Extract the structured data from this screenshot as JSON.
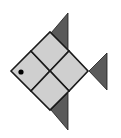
{
  "diagram": {
    "colors": {
      "background": "#ffffff",
      "diamond_fill": "#cfcfcf",
      "fin_fill": "#5a5a5a",
      "outline": "#1a1a1a",
      "gap_line": "#ffffff",
      "eye": "#000000"
    },
    "shapes": {
      "diamonds": [
        {
          "name": "diamond-left",
          "points": "11,71 31,51 50,71 31,91"
        },
        {
          "name": "diamond-top",
          "points": "31,51 50,32 69,51 50,71"
        },
        {
          "name": "diamond-right",
          "points": "50,71 69,51 88,71 69,91"
        },
        {
          "name": "diamond-bottom",
          "points": "31,91 50,71 69,91 50,110"
        }
      ],
      "fins": [
        {
          "name": "top-fin",
          "points": "51,33 68,13 68,50"
        },
        {
          "name": "bottom-fin",
          "points": "51,110 68,93 68,130"
        },
        {
          "name": "tail-fin",
          "points": "89,71 107,53 107,90"
        }
      ],
      "eye": {
        "cx": 21,
        "cy": 72,
        "r": 2.6
      }
    }
  }
}
